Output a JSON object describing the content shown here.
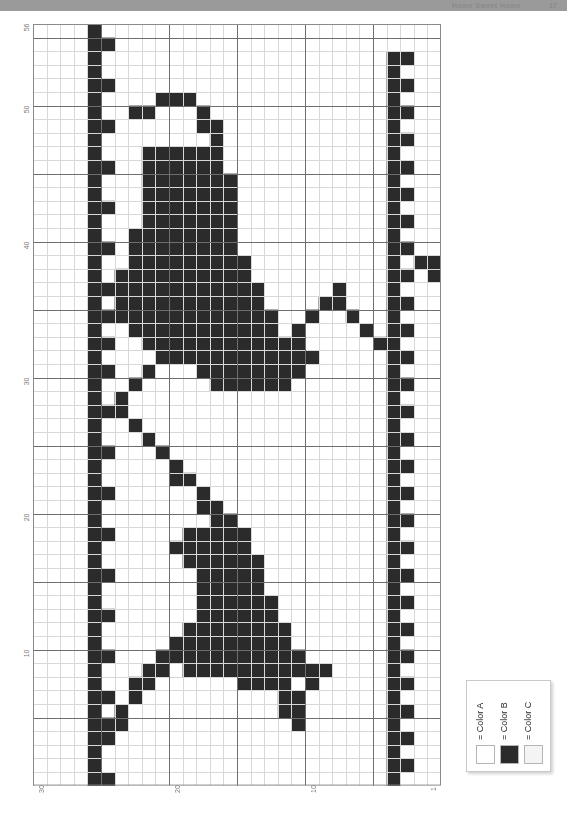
{
  "header": {
    "title": "Home Sweet Home",
    "page_number": "17"
  },
  "chart": {
    "columns": 30,
    "rows": 56,
    "cell_px": 13.6,
    "grid": {
      "minor_color": "#d8d8d8",
      "major_color": "#6e6e6e",
      "major_every": 5,
      "background": "#ffffff",
      "border_color": "#8a8a8a"
    },
    "axis_left": {
      "orientation": "vertical",
      "direction": "bottom-to-top",
      "ticks": [
        {
          "label": "56",
          "row": 56
        },
        {
          "label": "50",
          "row": 50
        },
        {
          "label": "40",
          "row": 40
        },
        {
          "label": "30",
          "row": 30
        },
        {
          "label": "20",
          "row": 20
        },
        {
          "label": "10",
          "row": 10
        }
      ]
    },
    "axis_bottom": {
      "orientation": "horizontal",
      "direction": "right-to-left",
      "ticks": [
        {
          "label": "30",
          "col": 30
        },
        {
          "label": "20",
          "col": 20
        },
        {
          "label": "10",
          "col": 10
        },
        {
          "label": "1",
          "col": 1
        }
      ]
    },
    "stitch_color": "#2b2b2b",
    "stitch_symbol": "Color B",
    "stitches": [
      [
        26,
        56
      ],
      [
        25,
        55
      ],
      [
        26,
        55
      ],
      [
        26,
        54
      ],
      [
        3,
        54
      ],
      [
        4,
        54
      ],
      [
        26,
        53
      ],
      [
        4,
        53
      ],
      [
        25,
        52
      ],
      [
        26,
        52
      ],
      [
        3,
        52
      ],
      [
        4,
        52
      ],
      [
        19,
        51
      ],
      [
        20,
        51
      ],
      [
        26,
        51
      ],
      [
        4,
        51
      ],
      [
        21,
        51
      ],
      [
        18,
        50
      ],
      [
        26,
        50
      ],
      [
        3,
        50
      ],
      [
        4,
        50
      ],
      [
        22,
        50
      ],
      [
        23,
        50
      ],
      [
        17,
        49
      ],
      [
        18,
        49
      ],
      [
        25,
        49
      ],
      [
        26,
        49
      ],
      [
        4,
        49
      ],
      [
        17,
        48
      ],
      [
        26,
        48
      ],
      [
        3,
        48
      ],
      [
        4,
        48
      ],
      [
        17,
        47
      ],
      [
        18,
        47
      ],
      [
        19,
        47
      ],
      [
        20,
        47
      ],
      [
        21,
        47
      ],
      [
        22,
        47
      ],
      [
        26,
        47
      ],
      [
        4,
        47
      ],
      [
        17,
        46
      ],
      [
        18,
        46
      ],
      [
        19,
        46
      ],
      [
        20,
        46
      ],
      [
        21,
        46
      ],
      [
        22,
        46
      ],
      [
        25,
        46
      ],
      [
        26,
        46
      ],
      [
        3,
        46
      ],
      [
        4,
        46
      ],
      [
        16,
        45
      ],
      [
        17,
        45
      ],
      [
        18,
        45
      ],
      [
        19,
        45
      ],
      [
        20,
        45
      ],
      [
        21,
        45
      ],
      [
        22,
        45
      ],
      [
        26,
        45
      ],
      [
        4,
        45
      ],
      [
        16,
        44
      ],
      [
        17,
        44
      ],
      [
        18,
        44
      ],
      [
        19,
        44
      ],
      [
        20,
        44
      ],
      [
        21,
        44
      ],
      [
        22,
        44
      ],
      [
        26,
        44
      ],
      [
        3,
        44
      ],
      [
        4,
        44
      ],
      [
        16,
        43
      ],
      [
        17,
        43
      ],
      [
        18,
        43
      ],
      [
        19,
        43
      ],
      [
        20,
        43
      ],
      [
        21,
        43
      ],
      [
        22,
        43
      ],
      [
        25,
        43
      ],
      [
        26,
        43
      ],
      [
        4,
        43
      ],
      [
        16,
        42
      ],
      [
        17,
        42
      ],
      [
        18,
        42
      ],
      [
        19,
        42
      ],
      [
        20,
        42
      ],
      [
        21,
        42
      ],
      [
        22,
        42
      ],
      [
        26,
        42
      ],
      [
        3,
        42
      ],
      [
        4,
        42
      ],
      [
        16,
        41
      ],
      [
        17,
        41
      ],
      [
        18,
        41
      ],
      [
        19,
        41
      ],
      [
        20,
        41
      ],
      [
        21,
        41
      ],
      [
        22,
        41
      ],
      [
        23,
        41
      ],
      [
        26,
        41
      ],
      [
        4,
        41
      ],
      [
        16,
        40
      ],
      [
        17,
        40
      ],
      [
        18,
        40
      ],
      [
        19,
        40
      ],
      [
        20,
        40
      ],
      [
        21,
        40
      ],
      [
        22,
        40
      ],
      [
        23,
        40
      ],
      [
        25,
        40
      ],
      [
        26,
        40
      ],
      [
        3,
        40
      ],
      [
        4,
        40
      ],
      [
        15,
        39
      ],
      [
        16,
        39
      ],
      [
        17,
        39
      ],
      [
        18,
        39
      ],
      [
        19,
        39
      ],
      [
        20,
        39
      ],
      [
        21,
        39
      ],
      [
        22,
        39
      ],
      [
        23,
        39
      ],
      [
        26,
        39
      ],
      [
        4,
        39
      ],
      [
        1,
        39
      ],
      [
        2,
        39
      ],
      [
        15,
        38
      ],
      [
        16,
        38
      ],
      [
        17,
        38
      ],
      [
        18,
        38
      ],
      [
        19,
        38
      ],
      [
        20,
        38
      ],
      [
        21,
        38
      ],
      [
        22,
        38
      ],
      [
        23,
        38
      ],
      [
        24,
        38
      ],
      [
        26,
        38
      ],
      [
        3,
        38
      ],
      [
        4,
        38
      ],
      [
        1,
        38
      ],
      [
        14,
        37
      ],
      [
        15,
        37
      ],
      [
        16,
        37
      ],
      [
        17,
        37
      ],
      [
        18,
        37
      ],
      [
        19,
        37
      ],
      [
        20,
        37
      ],
      [
        21,
        37
      ],
      [
        22,
        37
      ],
      [
        23,
        37
      ],
      [
        24,
        37
      ],
      [
        25,
        37
      ],
      [
        26,
        37
      ],
      [
        4,
        37
      ],
      [
        8,
        37
      ],
      [
        14,
        36
      ],
      [
        15,
        36
      ],
      [
        16,
        36
      ],
      [
        17,
        36
      ],
      [
        18,
        36
      ],
      [
        19,
        36
      ],
      [
        20,
        36
      ],
      [
        21,
        36
      ],
      [
        22,
        36
      ],
      [
        23,
        36
      ],
      [
        24,
        36
      ],
      [
        26,
        36
      ],
      [
        3,
        36
      ],
      [
        4,
        36
      ],
      [
        8,
        36
      ],
      [
        9,
        36
      ],
      [
        13,
        35
      ],
      [
        14,
        35
      ],
      [
        15,
        35
      ],
      [
        16,
        35
      ],
      [
        17,
        35
      ],
      [
        18,
        35
      ],
      [
        19,
        35
      ],
      [
        20,
        35
      ],
      [
        21,
        35
      ],
      [
        22,
        35
      ],
      [
        23,
        35
      ],
      [
        24,
        35
      ],
      [
        25,
        35
      ],
      [
        26,
        35
      ],
      [
        4,
        35
      ],
      [
        7,
        35
      ],
      [
        10,
        35
      ],
      [
        13,
        34
      ],
      [
        14,
        34
      ],
      [
        15,
        34
      ],
      [
        16,
        34
      ],
      [
        17,
        34
      ],
      [
        18,
        34
      ],
      [
        19,
        34
      ],
      [
        20,
        34
      ],
      [
        21,
        34
      ],
      [
        22,
        34
      ],
      [
        23,
        34
      ],
      [
        26,
        34
      ],
      [
        3,
        34
      ],
      [
        4,
        34
      ],
      [
        6,
        34
      ],
      [
        11,
        34
      ],
      [
        12,
        33
      ],
      [
        13,
        33
      ],
      [
        14,
        33
      ],
      [
        15,
        33
      ],
      [
        16,
        33
      ],
      [
        17,
        33
      ],
      [
        18,
        33
      ],
      [
        19,
        33
      ],
      [
        20,
        33
      ],
      [
        21,
        33
      ],
      [
        22,
        33
      ],
      [
        25,
        33
      ],
      [
        26,
        33
      ],
      [
        4,
        33
      ],
      [
        5,
        33
      ],
      [
        11,
        33
      ],
      [
        12,
        33
      ],
      [
        11,
        32
      ],
      [
        12,
        32
      ],
      [
        13,
        32
      ],
      [
        14,
        32
      ],
      [
        15,
        32
      ],
      [
        16,
        32
      ],
      [
        17,
        32
      ],
      [
        18,
        32
      ],
      [
        19,
        32
      ],
      [
        20,
        32
      ],
      [
        26,
        32
      ],
      [
        3,
        32
      ],
      [
        4,
        32
      ],
      [
        10,
        32
      ],
      [
        21,
        32
      ],
      [
        11,
        31
      ],
      [
        12,
        31
      ],
      [
        13,
        31
      ],
      [
        14,
        31
      ],
      [
        15,
        31
      ],
      [
        16,
        31
      ],
      [
        17,
        31
      ],
      [
        18,
        31
      ],
      [
        25,
        31
      ],
      [
        26,
        31
      ],
      [
        4,
        31
      ],
      [
        22,
        31
      ],
      [
        12,
        30
      ],
      [
        13,
        30
      ],
      [
        14,
        30
      ],
      [
        15,
        30
      ],
      [
        16,
        30
      ],
      [
        17,
        30
      ],
      [
        26,
        30
      ],
      [
        3,
        30
      ],
      [
        4,
        30
      ],
      [
        23,
        30
      ],
      [
        26,
        29
      ],
      [
        4,
        29
      ],
      [
        24,
        29
      ],
      [
        25,
        28
      ],
      [
        26,
        28
      ],
      [
        3,
        28
      ],
      [
        4,
        28
      ],
      [
        24,
        28
      ],
      [
        26,
        27
      ],
      [
        4,
        27
      ],
      [
        23,
        27
      ],
      [
        26,
        26
      ],
      [
        3,
        26
      ],
      [
        4,
        26
      ],
      [
        22,
        26
      ],
      [
        25,
        25
      ],
      [
        26,
        25
      ],
      [
        4,
        25
      ],
      [
        21,
        25
      ],
      [
        26,
        24
      ],
      [
        3,
        24
      ],
      [
        4,
        24
      ],
      [
        20,
        24
      ],
      [
        26,
        23
      ],
      [
        4,
        23
      ],
      [
        19,
        23
      ],
      [
        20,
        23
      ],
      [
        25,
        22
      ],
      [
        26,
        22
      ],
      [
        3,
        22
      ],
      [
        4,
        22
      ],
      [
        18,
        22
      ],
      [
        26,
        21
      ],
      [
        4,
        21
      ],
      [
        17,
        21
      ],
      [
        18,
        21
      ],
      [
        26,
        20
      ],
      [
        3,
        20
      ],
      [
        4,
        20
      ],
      [
        16,
        20
      ],
      [
        17,
        20
      ],
      [
        25,
        19
      ],
      [
        26,
        19
      ],
      [
        4,
        19
      ],
      [
        15,
        19
      ],
      [
        16,
        19
      ],
      [
        17,
        19
      ],
      [
        18,
        19
      ],
      [
        19,
        19
      ],
      [
        26,
        18
      ],
      [
        3,
        18
      ],
      [
        4,
        18
      ],
      [
        15,
        18
      ],
      [
        16,
        18
      ],
      [
        17,
        18
      ],
      [
        18,
        18
      ],
      [
        19,
        18
      ],
      [
        20,
        18
      ],
      [
        26,
        17
      ],
      [
        4,
        17
      ],
      [
        14,
        17
      ],
      [
        15,
        17
      ],
      [
        16,
        17
      ],
      [
        17,
        17
      ],
      [
        18,
        17
      ],
      [
        19,
        17
      ],
      [
        25,
        16
      ],
      [
        26,
        16
      ],
      [
        3,
        16
      ],
      [
        4,
        16
      ],
      [
        14,
        16
      ],
      [
        15,
        16
      ],
      [
        16,
        16
      ],
      [
        17,
        16
      ],
      [
        18,
        16
      ],
      [
        26,
        15
      ],
      [
        4,
        15
      ],
      [
        14,
        15
      ],
      [
        15,
        15
      ],
      [
        16,
        15
      ],
      [
        17,
        15
      ],
      [
        18,
        15
      ],
      [
        26,
        14
      ],
      [
        3,
        14
      ],
      [
        4,
        14
      ],
      [
        13,
        14
      ],
      [
        14,
        14
      ],
      [
        15,
        14
      ],
      [
        16,
        14
      ],
      [
        17,
        14
      ],
      [
        18,
        14
      ],
      [
        25,
        13
      ],
      [
        26,
        13
      ],
      [
        4,
        13
      ],
      [
        13,
        13
      ],
      [
        14,
        13
      ],
      [
        15,
        13
      ],
      [
        16,
        13
      ],
      [
        17,
        13
      ],
      [
        18,
        13
      ],
      [
        26,
        12
      ],
      [
        3,
        12
      ],
      [
        4,
        12
      ],
      [
        12,
        12
      ],
      [
        13,
        12
      ],
      [
        14,
        12
      ],
      [
        15,
        12
      ],
      [
        16,
        12
      ],
      [
        17,
        12
      ],
      [
        18,
        12
      ],
      [
        19,
        12
      ],
      [
        26,
        11
      ],
      [
        4,
        11
      ],
      [
        12,
        11
      ],
      [
        13,
        11
      ],
      [
        14,
        11
      ],
      [
        15,
        11
      ],
      [
        16,
        11
      ],
      [
        17,
        11
      ],
      [
        18,
        11
      ],
      [
        19,
        11
      ],
      [
        20,
        11
      ],
      [
        25,
        10
      ],
      [
        26,
        10
      ],
      [
        3,
        10
      ],
      [
        4,
        10
      ],
      [
        11,
        10
      ],
      [
        12,
        10
      ],
      [
        13,
        10
      ],
      [
        14,
        10
      ],
      [
        15,
        10
      ],
      [
        16,
        10
      ],
      [
        17,
        10
      ],
      [
        18,
        10
      ],
      [
        19,
        10
      ],
      [
        20,
        10
      ],
      [
        21,
        10
      ],
      [
        26,
        9
      ],
      [
        4,
        9
      ],
      [
        9,
        9
      ],
      [
        10,
        9
      ],
      [
        11,
        9
      ],
      [
        12,
        9
      ],
      [
        13,
        9
      ],
      [
        14,
        9
      ],
      [
        15,
        9
      ],
      [
        16,
        9
      ],
      [
        17,
        9
      ],
      [
        18,
        9
      ],
      [
        19,
        9
      ],
      [
        21,
        9
      ],
      [
        22,
        9
      ],
      [
        26,
        8
      ],
      [
        3,
        8
      ],
      [
        4,
        8
      ],
      [
        10,
        8
      ],
      [
        12,
        8
      ],
      [
        13,
        8
      ],
      [
        14,
        8
      ],
      [
        15,
        8
      ],
      [
        22,
        8
      ],
      [
        23,
        8
      ],
      [
        25,
        7
      ],
      [
        26,
        7
      ],
      [
        4,
        7
      ],
      [
        11,
        7
      ],
      [
        12,
        7
      ],
      [
        23,
        7
      ],
      [
        26,
        6
      ],
      [
        3,
        6
      ],
      [
        4,
        6
      ],
      [
        11,
        6
      ],
      [
        12,
        6
      ],
      [
        24,
        6
      ],
      [
        26,
        5
      ],
      [
        4,
        5
      ],
      [
        11,
        5
      ],
      [
        24,
        5
      ],
      [
        25,
        5
      ],
      [
        25,
        4
      ],
      [
        26,
        4
      ],
      [
        3,
        4
      ],
      [
        4,
        4
      ],
      [
        26,
        3
      ],
      [
        4,
        3
      ],
      [
        26,
        2
      ],
      [
        3,
        2
      ],
      [
        4,
        2
      ],
      [
        25,
        1
      ],
      [
        26,
        1
      ],
      [
        4,
        1
      ]
    ]
  },
  "legend": {
    "title": "Legend",
    "entries": [
      {
        "label": "= Color A",
        "swatch": "#ffffff",
        "symbol": "A"
      },
      {
        "label": "= Color B",
        "swatch": "#2b2b2b",
        "symbol": "B"
      },
      {
        "label": "= Color C",
        "swatch": "#f4f4f4",
        "symbol": "C"
      }
    ]
  }
}
